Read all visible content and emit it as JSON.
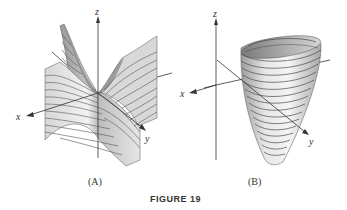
{
  "figure": {
    "caption": "FIGURE 19",
    "panels": [
      {
        "id": "A",
        "label": "(A)",
        "surface": "saddle-shaped surface with horizontal level-curve stripes",
        "axes": {
          "x": "x",
          "y": "y",
          "z": "z"
        }
      },
      {
        "id": "B",
        "label": "(B)",
        "surface": "upward-opening elliptic paraboloid with horizontal level-curve rings",
        "axes": {
          "x": "x",
          "y": "y",
          "z": "z"
        }
      }
    ]
  },
  "colors": {
    "surface_light": "#eeeeee",
    "surface_mid": "#c8c8c8",
    "surface_dark": "#8a8a8a",
    "stripe": "#555555",
    "axis": "#333333"
  }
}
